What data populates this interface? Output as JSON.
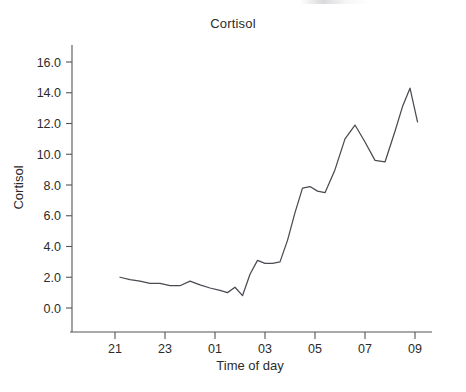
{
  "chart_data": {
    "type": "line",
    "title": "Cortisol",
    "xlabel": "Time of day",
    "ylabel": "Cortisol",
    "grid": false,
    "legend": false,
    "xlim": [
      20.0,
      10.0
    ],
    "ylim": [
      -0.4,
      17.2
    ],
    "xtick_labels": [
      "21",
      "23",
      "01",
      "03",
      "05",
      "07",
      "09"
    ],
    "xtick_values": [
      21,
      23,
      1,
      3,
      5,
      7,
      9
    ],
    "ytick_labels": [
      "0.0",
      "2.0",
      "4.0",
      "6.0",
      "8.0",
      "10.0",
      "12.0",
      "14.0",
      "16.0"
    ],
    "ytick_values": [
      0.0,
      2.0,
      4.0,
      6.0,
      8.0,
      10.0,
      12.0,
      14.0,
      16.0
    ],
    "series": [
      {
        "name": "Cortisol",
        "color": "#4a4a52",
        "x": [
          21.2,
          21.6,
          22.0,
          22.4,
          22.8,
          23.2,
          23.6,
          24.0,
          24.4,
          24.8,
          25.2,
          25.5,
          25.8,
          26.1,
          26.4,
          26.7,
          27.0,
          27.3,
          27.6,
          27.9,
          28.2,
          28.5,
          28.8,
          29.1,
          29.4,
          29.8,
          30.2,
          30.6,
          31.0,
          31.4,
          31.8,
          32.2,
          32.5,
          32.8,
          33.1
        ],
        "x_labels": [
          "21:12",
          "21:36",
          "22:00",
          "22:24",
          "22:48",
          "23:12",
          "23:36",
          "00:00",
          "00:24",
          "00:48",
          "01:12",
          "01:30",
          "01:48",
          "02:06",
          "02:24",
          "02:42",
          "03:00",
          "03:18",
          "03:36",
          "03:54",
          "04:12",
          "04:30",
          "04:48",
          "05:06",
          "05:24",
          "05:48",
          "06:12",
          "06:36",
          "07:00",
          "07:24",
          "07:48",
          "08:12",
          "08:30",
          "08:48",
          "09:06"
        ],
        "y": [
          2.0,
          1.85,
          1.75,
          1.6,
          1.6,
          1.45,
          1.45,
          1.75,
          1.5,
          1.3,
          1.15,
          1.0,
          1.35,
          0.8,
          2.2,
          3.1,
          2.9,
          2.9,
          3.0,
          4.4,
          6.2,
          7.8,
          7.9,
          7.6,
          7.5,
          9.0,
          11.0,
          11.9,
          10.8,
          9.6,
          9.5,
          11.5,
          13.1,
          14.3,
          12.1
        ]
      }
    ]
  },
  "figure": {
    "background_color": "#ffffff",
    "line_color": "#4a4a52",
    "axis_color": "#555555",
    "text_color": "#2b2b2b"
  }
}
